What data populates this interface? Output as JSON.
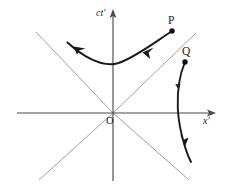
{
  "figure": {
    "kind": "minkowski-spacetime-diagram",
    "background_color": "#ffffff",
    "axis_color": "#4a4a52",
    "lightcone_color": "#9a9aa2",
    "worldline_color": "#1a1a1a"
  },
  "axes": {
    "vertical": {
      "label": "ct",
      "prime": "′",
      "name": "ct-prime-axis",
      "label_x": 96,
      "label_y": 8
    },
    "horizontal": {
      "label": "x",
      "prime": "′",
      "name": "x-prime-axis",
      "label_x": 203,
      "label_y": 116
    },
    "origin": {
      "label": "O",
      "label_x": 106,
      "label_y": 116
    }
  },
  "events": [
    {
      "label": "P",
      "name": "event-p",
      "label_x": 168,
      "label_y": 15,
      "dot_x": 172,
      "dot_y": 31
    },
    {
      "label": "Q",
      "name": "event-q",
      "label_x": 182,
      "label_y": 46,
      "dot_x": 185,
      "dot_y": 62
    }
  ],
  "worldlines": [
    {
      "name": "worldline-p",
      "note": "upper hyperbola branch, arrows directed toward upper-left, terminating at event P"
    },
    {
      "name": "worldline-q",
      "note": "right hyperbola branch, arrows directed downward, originating at event Q"
    }
  ],
  "lightcone_lines": [
    {
      "name": "lightcone-upper-left"
    },
    {
      "name": "lightcone-upper-right"
    },
    {
      "name": "lightcone-lower-left"
    },
    {
      "name": "lightcone-lower-right"
    }
  ]
}
